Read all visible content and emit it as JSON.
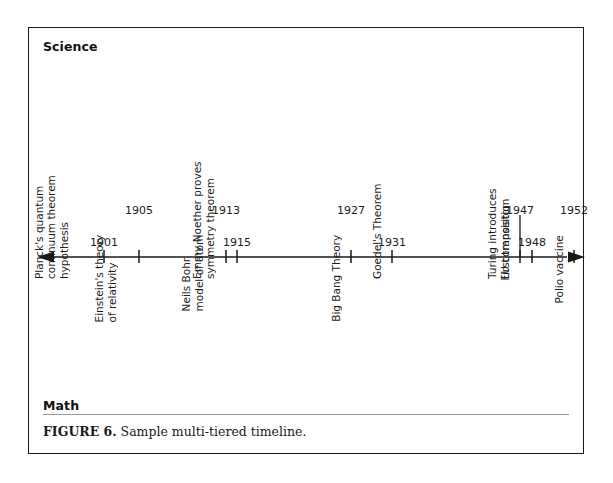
{
  "figure": {
    "caption_label": "FIGURE 6.",
    "caption_text": " Sample multi-tiered timeline.",
    "border_color": "#1a1a1a",
    "background": "#ffffff"
  },
  "tiers": {
    "top_heading": "Science",
    "bottom_heading": "Math"
  },
  "axis": {
    "line_color": "#1a1a1a",
    "left_arrow": "arrow-left",
    "right_arrow": "arrow-right",
    "x_start": 12,
    "x_end": 544
  },
  "chart_data": {
    "type": "timeline",
    "title": "Sample multi-tiered timeline",
    "tiers": [
      "Science",
      "Math"
    ],
    "axis_direction": "both",
    "events": [
      {
        "year": "1901",
        "year_side": "below",
        "tier": "Math",
        "label_lines": [
          "Planck's quantum",
          "continuum theorem",
          "hypothesis"
        ],
        "x": 75,
        "leader": false
      },
      {
        "year": "1905",
        "year_side": "above",
        "tier": "Science",
        "label_lines": [
          "Einstein's theory",
          "of relativity"
        ],
        "x": 110,
        "leader": false
      },
      {
        "year": "1913",
        "year_side": "above",
        "tier": "Science",
        "label_lines": [
          "Neils Bohr",
          "model of atom"
        ],
        "x": 197,
        "leader": false
      },
      {
        "year": "1915",
        "year_side": "below",
        "tier": "Math",
        "label_lines": [
          "Emmy Noether proves",
          "symmetry theorem"
        ],
        "x": 208,
        "leader": false
      },
      {
        "year": "1927",
        "year_side": "above",
        "tier": "Science",
        "label_lines": [
          "Big Bang Theory"
        ],
        "x": 322,
        "leader": false
      },
      {
        "year": "1931",
        "year_side": "below",
        "tier": "Math",
        "label_lines": [
          "Goedel's Theorem"
        ],
        "x": 363,
        "leader": false
      },
      {
        "year": "1947",
        "year_side": "above",
        "tier": "Science",
        "label_lines": [
          "First transistor"
        ],
        "x": 491,
        "leader": true
      },
      {
        "year": "1948",
        "year_side": "below",
        "tier": "Math",
        "label_lines": [
          "Turing introduces",
          "LU composition"
        ],
        "x": 503,
        "leader": false
      },
      {
        "year": "1952",
        "year_side": "above",
        "tier": "Science",
        "label_lines": [
          "Polio vaccine"
        ],
        "x": 545,
        "leader": false
      }
    ]
  }
}
